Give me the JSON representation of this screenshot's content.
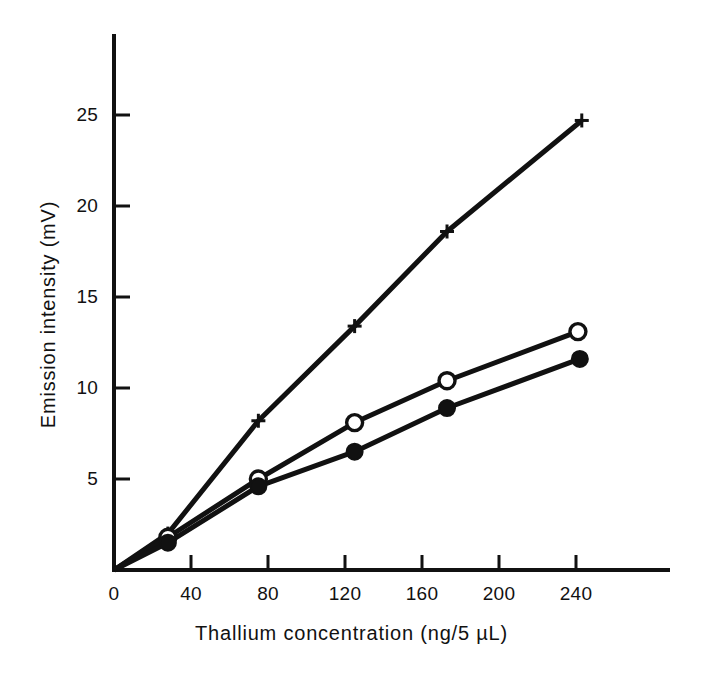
{
  "chart_data": {
    "type": "line",
    "title": "",
    "xlabel": "Thallium concentration (ng/5 µL)",
    "ylabel": "Emission intensity (mV)",
    "xlim": [
      0,
      275
    ],
    "ylim": [
      0,
      26.5
    ],
    "grid": false,
    "legend": "none",
    "xticks": [
      0,
      40,
      80,
      120,
      160,
      200,
      240
    ],
    "xtick_labels": [
      "0",
      "40",
      "80",
      "120",
      "160",
      "200",
      "240"
    ],
    "yticks": [
      5,
      10,
      15,
      20,
      25
    ],
    "ytick_labels": [
      "5",
      "10",
      "15",
      "20",
      "25"
    ],
    "series": [
      {
        "name": "plus-series",
        "marker": "plus",
        "fill": "none",
        "color": "#111111",
        "x": [
          0,
          28,
          75,
          125,
          173,
          243
        ],
        "values": [
          0,
          2.0,
          8.2,
          13.4,
          18.6,
          24.7
        ]
      },
      {
        "name": "open-circle-series",
        "marker": "circle-open",
        "fill": "#ffffff",
        "color": "#111111",
        "x": [
          0,
          28,
          75,
          125,
          173,
          241
        ],
        "values": [
          0,
          1.8,
          5.0,
          8.1,
          10.4,
          13.1
        ]
      },
      {
        "name": "filled-circle-series",
        "marker": "circle-filled",
        "fill": "#111111",
        "color": "#111111",
        "x": [
          0,
          28,
          75,
          125,
          173,
          242
        ],
        "values": [
          0,
          1.5,
          4.6,
          6.5,
          8.9,
          11.6
        ]
      }
    ]
  },
  "axes": {
    "x_title": "Thallium concentration (ng/5 µL)",
    "y_title": "Emission intensity (mV)"
  },
  "xtick_labels": {
    "t0": "0",
    "t1": "40",
    "t2": "80",
    "t3": "120",
    "t4": "160",
    "t5": "200",
    "t6": "240"
  },
  "ytick_labels": {
    "t5": "5",
    "t10": "10",
    "t15": "15",
    "t20": "20",
    "t25": "25"
  }
}
